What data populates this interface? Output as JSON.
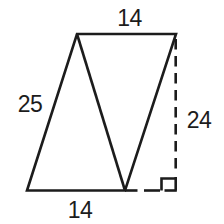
{
  "figure": {
    "type": "geometry-diagram",
    "labels": {
      "top_side": "14",
      "left_side": "25",
      "altitude": "24",
      "bottom_side": "14"
    },
    "colors": {
      "line": "#1c1c1c",
      "text": "#1c1c1c",
      "background": "#ffffff"
    }
  }
}
